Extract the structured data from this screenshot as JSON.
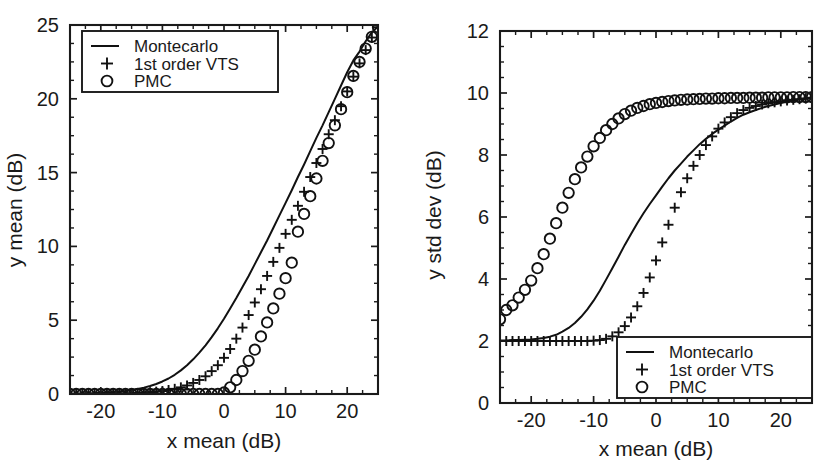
{
  "figure": {
    "background": "#ffffff",
    "ink_color": "#1a1a1a",
    "panel_count": 2
  },
  "chart_data": [
    {
      "id": "left",
      "type": "line",
      "title": "",
      "xlabel": "x mean (dB)",
      "ylabel": "y mean (dB)",
      "xlim": [
        -25,
        25
      ],
      "ylim": [
        0,
        25
      ],
      "xticks": [
        -20,
        -10,
        0,
        10,
        20
      ],
      "xticklabels": [
        "-20",
        "-10",
        "0",
        "10",
        "20"
      ],
      "yticks": [
        0,
        5,
        10,
        15,
        20,
        25
      ],
      "yticklabels": [
        "0",
        "5",
        "10",
        "15",
        "20",
        "25"
      ],
      "grid": false,
      "minor_ticks": true,
      "legend_position": "upper-left",
      "legend": [
        "Montecarlo",
        "1st order VTS",
        "PMC"
      ],
      "series": [
        {
          "name": "Montecarlo",
          "style": "line",
          "marker": "none",
          "x": [
            -25,
            -24,
            -23,
            -22,
            -21,
            -20,
            -19,
            -18,
            -17,
            -16,
            -15,
            -14,
            -13,
            -12,
            -11,
            -10,
            -9,
            -8,
            -7,
            -6,
            -5,
            -4,
            -3,
            -2,
            -1,
            0,
            1,
            2,
            3,
            4,
            5,
            6,
            7,
            8,
            9,
            10,
            11,
            12,
            13,
            14,
            15,
            16,
            17,
            18,
            19,
            20,
            21,
            22,
            23,
            24,
            25
          ],
          "y": [
            0.02,
            0.03,
            0.04,
            0.05,
            0.06,
            0.08,
            0.1,
            0.13,
            0.17,
            0.21,
            0.27,
            0.34,
            0.43,
            0.54,
            0.68,
            0.85,
            1.05,
            1.3,
            1.6,
            1.95,
            2.35,
            2.8,
            3.3,
            3.85,
            4.45,
            5.1,
            5.8,
            6.5,
            7.25,
            8.0,
            8.8,
            9.6,
            10.4,
            11.25,
            12.1,
            12.95,
            13.8,
            14.7,
            15.55,
            16.45,
            17.35,
            18.2,
            19.1,
            20.0,
            20.9,
            21.8,
            22.6,
            23.2,
            23.9,
            24.5,
            24.9
          ]
        },
        {
          "name": "1st order VTS",
          "style": "markers",
          "marker": "+",
          "x": [
            -25,
            -24,
            -23,
            -22,
            -21,
            -20,
            -19,
            -18,
            -17,
            -16,
            -15,
            -14,
            -13,
            -12,
            -11,
            -10,
            -9,
            -8,
            -7,
            -6,
            -5,
            -4,
            -3,
            -2,
            -1,
            0,
            1,
            2,
            3,
            4,
            5,
            6,
            7,
            8,
            9,
            10,
            11,
            12,
            13,
            14,
            15,
            16,
            17,
            18,
            19,
            20,
            21,
            22,
            23,
            24,
            25
          ],
          "y": [
            0.0,
            0.0,
            0.0,
            0.0,
            0.0,
            0.01,
            0.01,
            0.02,
            0.03,
            0.04,
            0.05,
            0.07,
            0.09,
            0.12,
            0.16,
            0.2,
            0.27,
            0.35,
            0.45,
            0.58,
            0.75,
            0.95,
            1.2,
            1.55,
            1.95,
            2.45,
            3.05,
            3.75,
            4.5,
            5.35,
            6.2,
            7.1,
            8.0,
            8.95,
            9.9,
            10.85,
            11.8,
            12.75,
            13.7,
            14.7,
            15.65,
            16.6,
            17.6,
            18.55,
            19.5,
            20.5,
            21.5,
            22.4,
            23.3,
            24.15,
            24.85
          ]
        },
        {
          "name": "PMC",
          "style": "markers",
          "marker": "o",
          "x": [
            -25,
            -24,
            -23,
            -22,
            -21,
            -20,
            -19,
            -18,
            -17,
            -16,
            -15,
            -14,
            -13,
            -12,
            -11,
            -10,
            -9,
            -8,
            -7,
            -6,
            -5,
            -4,
            -3,
            -2,
            -1,
            0,
            1,
            2,
            3,
            4,
            5,
            6,
            7,
            8,
            9,
            10,
            11,
            12,
            13,
            14,
            15,
            16,
            17,
            18,
            19,
            20,
            21,
            22,
            23,
            24,
            25
          ],
          "y": [
            0.0,
            0.0,
            0.0,
            0.0,
            0.0,
            0.0,
            0.0,
            0.0,
            0.0,
            0.0,
            0.0,
            0.0,
            0.0,
            0.0,
            0.0,
            0.0,
            0.0,
            0.0,
            0.0,
            0.0,
            0.0,
            0.0,
            0.0,
            0.0,
            0.0,
            0.1,
            0.45,
            0.95,
            1.55,
            2.25,
            3.0,
            3.9,
            4.85,
            5.8,
            6.8,
            7.85,
            8.9,
            11.0,
            12.2,
            13.4,
            14.6,
            15.8,
            17.0,
            18.2,
            19.3,
            20.45,
            21.55,
            22.5,
            23.4,
            24.2,
            24.85
          ]
        }
      ]
    },
    {
      "id": "right",
      "type": "line",
      "title": "",
      "xlabel": "x mean (dB)",
      "ylabel": "y std dev (dB)",
      "xlim": [
        -25,
        25
      ],
      "ylim": [
        0,
        12
      ],
      "xticks": [
        -20,
        -10,
        0,
        10,
        20
      ],
      "xticklabels": [
        "-20",
        "-10",
        "0",
        "10",
        "20"
      ],
      "yticks": [
        0,
        2,
        4,
        6,
        8,
        10,
        12
      ],
      "yticklabels": [
        "0",
        "2",
        "4",
        "6",
        "8",
        "10",
        "12"
      ],
      "grid": false,
      "minor_ticks": true,
      "legend_position": "lower-right",
      "legend": [
        "Montecarlo",
        "1st order VTS",
        "PMC"
      ],
      "series": [
        {
          "name": "Montecarlo",
          "style": "line",
          "marker": "none",
          "x": [
            -25,
            -24,
            -23,
            -22,
            -21,
            -20,
            -19,
            -18,
            -17,
            -16,
            -15,
            -14,
            -13,
            -12,
            -11,
            -10,
            -9,
            -8,
            -7,
            -6,
            -5,
            -4,
            -3,
            -2,
            -1,
            0,
            1,
            2,
            3,
            4,
            5,
            6,
            7,
            8,
            9,
            10,
            11,
            12,
            13,
            14,
            15,
            16,
            17,
            18,
            19,
            20,
            21,
            22,
            23,
            24,
            25
          ],
          "y": [
            2.02,
            2.02,
            2.03,
            2.03,
            2.04,
            2.05,
            2.07,
            2.1,
            2.14,
            2.2,
            2.3,
            2.42,
            2.58,
            2.78,
            3.02,
            3.3,
            3.62,
            3.98,
            4.35,
            4.72,
            5.1,
            5.45,
            5.8,
            6.12,
            6.42,
            6.7,
            6.98,
            7.25,
            7.5,
            7.72,
            7.95,
            8.15,
            8.35,
            8.52,
            8.68,
            8.82,
            8.95,
            9.08,
            9.2,
            9.3,
            9.38,
            9.45,
            9.52,
            9.58,
            9.63,
            9.68,
            9.72,
            9.76,
            9.8,
            9.83,
            9.86
          ]
        },
        {
          "name": "1st order VTS",
          "style": "markers",
          "marker": "+",
          "x": [
            -25,
            -24,
            -23,
            -22,
            -21,
            -20,
            -19,
            -18,
            -17,
            -16,
            -15,
            -14,
            -13,
            -12,
            -11,
            -10,
            -9,
            -8,
            -7,
            -6,
            -5,
            -4,
            -3,
            -2,
            -1,
            0,
            1,
            2,
            3,
            4,
            5,
            6,
            7,
            8,
            9,
            10,
            11,
            12,
            13,
            14,
            15,
            16,
            17,
            18,
            19,
            20,
            21,
            22,
            23,
            24,
            25
          ],
          "y": [
            2.0,
            2.0,
            2.0,
            2.0,
            2.0,
            2.0,
            2.0,
            2.0,
            2.0,
            2.0,
            2.0,
            2.0,
            2.0,
            2.0,
            2.0,
            2.01,
            2.03,
            2.07,
            2.15,
            2.28,
            2.48,
            2.76,
            3.12,
            3.55,
            4.05,
            4.6,
            5.18,
            5.75,
            6.3,
            6.8,
            7.25,
            7.65,
            8.0,
            8.32,
            8.6,
            8.85,
            9.05,
            9.22,
            9.35,
            9.45,
            9.52,
            9.58,
            9.63,
            9.67,
            9.7,
            9.73,
            9.76,
            9.78,
            9.8,
            9.82,
            9.84
          ]
        },
        {
          "name": "PMC",
          "style": "markers",
          "marker": "o",
          "x": [
            -25,
            -24,
            -23,
            -22,
            -21,
            -20,
            -19,
            -18,
            -17,
            -16,
            -15,
            -14,
            -13,
            -12,
            -11,
            -10,
            -9,
            -8,
            -7,
            -6,
            -5,
            -4,
            -3,
            -2,
            -1,
            0,
            1,
            2,
            3,
            4,
            5,
            6,
            7,
            8,
            9,
            10,
            11,
            12,
            13,
            14,
            15,
            16,
            17,
            18,
            19,
            20,
            21,
            22,
            23,
            24,
            25
          ],
          "y": [
            2.7,
            3.0,
            3.15,
            3.4,
            3.65,
            3.95,
            4.35,
            4.8,
            5.3,
            5.8,
            6.3,
            6.78,
            7.22,
            7.6,
            7.95,
            8.28,
            8.55,
            8.8,
            9.0,
            9.18,
            9.32,
            9.43,
            9.52,
            9.58,
            9.64,
            9.68,
            9.71,
            9.74,
            9.76,
            9.78,
            9.79,
            9.8,
            9.81,
            9.82,
            9.82,
            9.83,
            9.83,
            9.84,
            9.84,
            9.84,
            9.85,
            9.85,
            9.85,
            9.86,
            9.86,
            9.86,
            9.86,
            9.87,
            9.87,
            9.87,
            9.87
          ]
        }
      ]
    }
  ]
}
